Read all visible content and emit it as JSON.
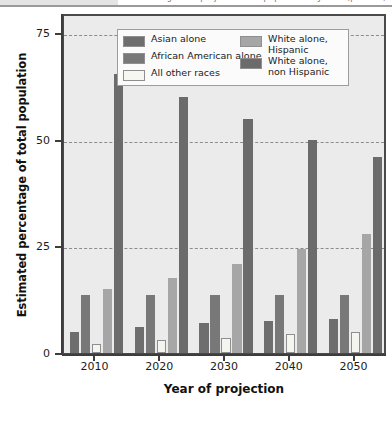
{
  "top_strip": {
    "clipped_text": "Figure — projected U.S. population by race (percent)"
  },
  "chart_data": {
    "type": "bar",
    "title": "",
    "xlabel": "Year of projection",
    "ylabel": "Estimated percentage of total population",
    "categories": [
      "2010",
      "2020",
      "2030",
      "2040",
      "2050"
    ],
    "ylim": [
      0,
      80
    ],
    "yticks": [
      0,
      25,
      50,
      75
    ],
    "ytick_labels": [
      "0",
      "25",
      "50",
      "75"
    ],
    "grid": true,
    "legend_position": "top-center-inside",
    "series": [
      {
        "name": "Asian alone",
        "color": "#6e6e6e",
        "values": [
          5,
          6,
          7,
          7.5,
          8
        ]
      },
      {
        "name": "African American alone",
        "color": "#787878",
        "values": [
          13.5,
          13.5,
          13.5,
          13.5,
          13.5
        ]
      },
      {
        "name": "All other races",
        "color": "#f5f5f0",
        "values": [
          2,
          3,
          3.5,
          4.5,
          5
        ]
      },
      {
        "name": "White alone, Hispanic",
        "color": "#a6a6a6",
        "values": [
          15,
          17.5,
          21,
          24.5,
          28
        ]
      },
      {
        "name": "White alone, non Hispanic",
        "color": "#6b6b6b",
        "values": [
          65.5,
          60,
          55,
          50,
          46
        ]
      }
    ]
  },
  "legend": {
    "left_items": [
      {
        "label": "Asian alone",
        "swatch": "sw-asian"
      },
      {
        "label": "African American alone",
        "swatch": "sw-african"
      },
      {
        "label": "All other races",
        "swatch": "sw-other"
      }
    ],
    "right_items": [
      {
        "label": "White alone,\nHispanic",
        "swatch": "sw-whitehisp"
      },
      {
        "label": "White alone,\nnon Hispanic",
        "swatch": "sw-whitenon"
      }
    ]
  }
}
